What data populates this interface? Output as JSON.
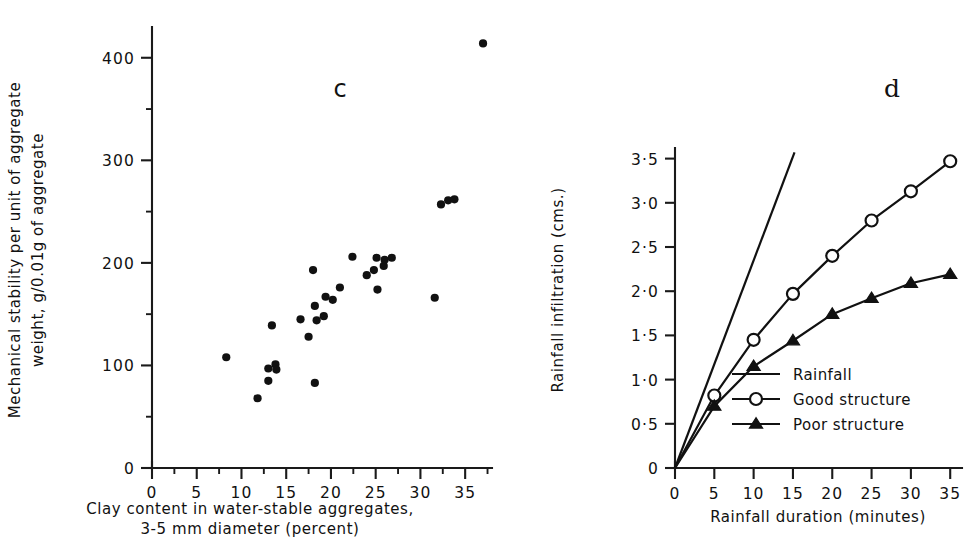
{
  "figure": {
    "background": "#ffffff",
    "ink_color": "#111111"
  },
  "panels": [
    {
      "id": "c",
      "letter": "c",
      "ylabel_line1": "Mechanical stability per unit of aggregate",
      "ylabel_line2": "weight, g/0.01g of aggregate",
      "xlabel_line1": "Clay content in water-stable aggregates,",
      "xlabel_line2": "3-5 mm diameter (percent)"
    },
    {
      "id": "d",
      "letter": "d",
      "ylabel": "Rainfall infiltration (cms.)",
      "xlabel": "Rainfall duration (minutes)"
    }
  ],
  "legend": {
    "title": "",
    "items": [
      {
        "label": "Rainfall",
        "marker": "line"
      },
      {
        "label": "Good structure",
        "marker": "open-circle"
      },
      {
        "label": "Poor structure",
        "marker": "filled-triangle"
      }
    ]
  },
  "chart_data": [
    {
      "type": "scatter",
      "panel": "c",
      "title": "c",
      "xlabel": "Clay content in water-stable aggregates, 3-5 mm diameter (percent)",
      "ylabel": "Mechanical stability per unit of aggregate weight, g/0.01g of aggregate",
      "xlim": [
        0,
        38
      ],
      "ylim": [
        0,
        430
      ],
      "xticks": [
        0,
        5,
        10,
        15,
        20,
        25,
        30,
        35
      ],
      "xtick_labels": [
        "0",
        "5",
        "10",
        "15",
        "20",
        "25",
        "30",
        "35"
      ],
      "xminor_step": 2.5,
      "yticks": [
        0,
        100,
        200,
        300,
        400
      ],
      "ytick_labels": [
        "0",
        "100",
        "200",
        "300",
        "400"
      ],
      "yminor_step": 50,
      "grid": false,
      "legend": "none",
      "points": [
        {
          "x": 8.3,
          "y": 108
        },
        {
          "x": 11.8,
          "y": 68
        },
        {
          "x": 13.0,
          "y": 97
        },
        {
          "x": 13.0,
          "y": 85
        },
        {
          "x": 13.8,
          "y": 101
        },
        {
          "x": 13.9,
          "y": 96
        },
        {
          "x": 13.4,
          "y": 139
        },
        {
          "x": 16.6,
          "y": 145
        },
        {
          "x": 17.5,
          "y": 128
        },
        {
          "x": 18.2,
          "y": 158
        },
        {
          "x": 18.4,
          "y": 144
        },
        {
          "x": 18.2,
          "y": 83
        },
        {
          "x": 18.0,
          "y": 193
        },
        {
          "x": 19.2,
          "y": 148
        },
        {
          "x": 19.4,
          "y": 167
        },
        {
          "x": 20.2,
          "y": 164
        },
        {
          "x": 21.0,
          "y": 176
        },
        {
          "x": 22.4,
          "y": 206
        },
        {
          "x": 24.0,
          "y": 188
        },
        {
          "x": 24.8,
          "y": 193
        },
        {
          "x": 25.1,
          "y": 205
        },
        {
          "x": 25.2,
          "y": 174
        },
        {
          "x": 25.9,
          "y": 197
        },
        {
          "x": 26.0,
          "y": 203
        },
        {
          "x": 26.8,
          "y": 205
        },
        {
          "x": 31.6,
          "y": 166
        },
        {
          "x": 32.3,
          "y": 257
        },
        {
          "x": 33.1,
          "y": 261
        },
        {
          "x": 33.8,
          "y": 262
        },
        {
          "x": 37.0,
          "y": 414
        }
      ]
    },
    {
      "type": "line",
      "panel": "d",
      "title": "d",
      "xlabel": "Rainfall duration (minutes)",
      "ylabel": "Rainfall infiltration (cms.)",
      "xlim": [
        0,
        36.5
      ],
      "ylim": [
        0,
        3.62
      ],
      "xticks": [
        0,
        5,
        10,
        15,
        20,
        25,
        30,
        35
      ],
      "xtick_labels": [
        "0",
        "5",
        "10",
        "15",
        "20",
        "25",
        "30",
        "35"
      ],
      "yticks": [
        0,
        0.5,
        1.0,
        1.5,
        2.0,
        2.5,
        3.0,
        3.5
      ],
      "ytick_labels": [
        "0",
        "0·5",
        "1·0",
        "1·5",
        "2·0",
        "2·5",
        "3·0",
        "3·5"
      ],
      "grid": false,
      "legend": "inside-lower-right",
      "series": [
        {
          "name": "Rainfall",
          "marker": "none",
          "x": [
            0,
            15.2
          ],
          "values": [
            0,
            3.57
          ]
        },
        {
          "name": "Good structure",
          "marker": "open-circle",
          "x": [
            0,
            5,
            10,
            15,
            20,
            25,
            30,
            35
          ],
          "values": [
            0,
            0.82,
            1.45,
            1.97,
            2.4,
            2.8,
            3.13,
            3.47
          ]
        },
        {
          "name": "Poor structure",
          "marker": "filled-triangle",
          "x": [
            0,
            5,
            10,
            15,
            20,
            25,
            30,
            35
          ],
          "values": [
            0,
            0.7,
            1.15,
            1.44,
            1.74,
            1.92,
            2.09,
            2.19
          ]
        }
      ]
    }
  ]
}
